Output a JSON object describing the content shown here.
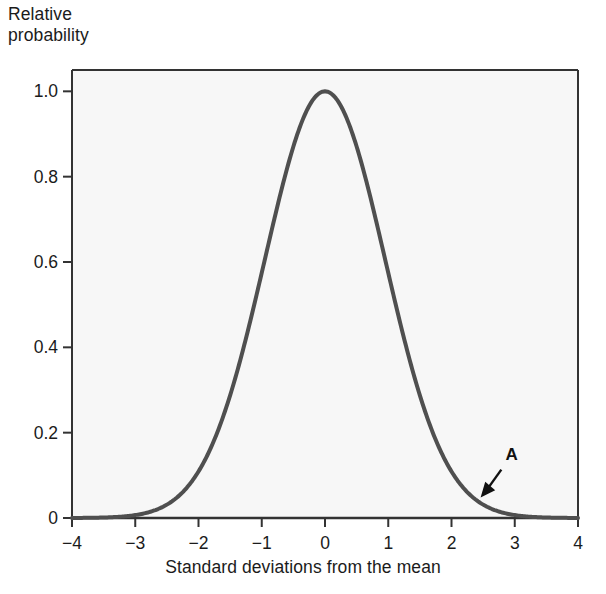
{
  "chart_data": {
    "type": "line",
    "title": "",
    "subtitle": "",
    "xlabel": "Standard deviations from the mean",
    "ylabel": "Relative\nprobability",
    "ylabel_line1": "Relative",
    "ylabel_line2": "probability",
    "xlim": [
      -4,
      4
    ],
    "ylim": [
      0,
      1.05
    ],
    "xticks": [
      -4,
      -3,
      -2,
      -1,
      0,
      1,
      2,
      3,
      4
    ],
    "xtick_labels": [
      "−4",
      "−3",
      "−2",
      "−1",
      "0",
      "1",
      "2",
      "3",
      "4"
    ],
    "yticks": [
      0,
      0.2,
      0.4,
      0.6,
      0.8,
      1.0
    ],
    "ytick_labels": [
      "0",
      "0.2",
      "0.4",
      "0.6",
      "0.8",
      "1.0"
    ],
    "grid": false,
    "legend": null,
    "series": [
      {
        "name": "Normal distribution (relative probability)",
        "curve": "gaussian",
        "peak_value": 1.0,
        "mean": 0,
        "sigma": 0.95,
        "color": "#4f4f4f",
        "line_width": 4,
        "x": [
          -4,
          -3.75,
          -3.5,
          -3.25,
          -3,
          -2.75,
          -2.5,
          -2.25,
          -2,
          -1.75,
          -1.5,
          -1.25,
          -1,
          -0.75,
          -0.5,
          -0.25,
          0,
          0.25,
          0.5,
          0.75,
          1,
          1.25,
          1.5,
          1.75,
          2,
          2.25,
          2.5,
          2.75,
          3,
          3.25,
          3.5,
          3.75,
          4
        ],
        "values": [
          0.0003,
          0.0009,
          0.0024,
          0.0058,
          0.0131,
          0.0275,
          0.0538,
          0.0983,
          0.1676,
          0.2668,
          0.3966,
          0.55,
          0.7045,
          0.834,
          0.9159,
          0.9657,
          1.0,
          0.9657,
          0.9159,
          0.834,
          0.7045,
          0.55,
          0.3966,
          0.2668,
          0.1676,
          0.0983,
          0.0538,
          0.0275,
          0.0131,
          0.0058,
          0.0024,
          0.0009,
          0.0003
        ]
      }
    ],
    "annotations": [
      {
        "label": "A",
        "label_x": 2.95,
        "label_y": 0.135,
        "arrow_tip_x": 2.46,
        "arrow_tip_y": 0.048,
        "description": "Arrow pointing to the right tail of the curve"
      }
    ]
  },
  "figure": {
    "background_color": "#ffffff",
    "plot_background_color": "#f7f7f7",
    "axis_color": "#333333",
    "curve_color": "#4f4f4f",
    "text_color": "#1b1b1b"
  }
}
